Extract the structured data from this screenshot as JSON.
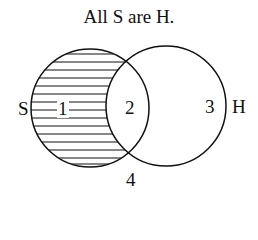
{
  "title": "All S are H.",
  "circles": [
    {
      "name": "S",
      "label": "S",
      "cx": 90,
      "cy": 108,
      "r": 59,
      "shaded_region": "1"
    },
    {
      "name": "H",
      "label": "H",
      "cx": 166,
      "cy": 106,
      "r": 60
    }
  ],
  "regions": [
    {
      "id": "1",
      "label": "1",
      "description": "S only (shaded, empty)"
    },
    {
      "id": "2",
      "label": "2",
      "description": "S and H"
    },
    {
      "id": "3",
      "label": "3",
      "description": "H only"
    },
    {
      "id": "4",
      "label": "4",
      "description": "neither S nor H"
    }
  ],
  "colors": {
    "line": "#111111",
    "background": "#ffffff"
  }
}
